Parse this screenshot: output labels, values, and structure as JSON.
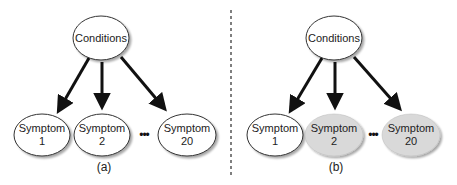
{
  "colors": {
    "observed_fill": "#d9d9d9",
    "unobserved_fill": "#ffffff",
    "stroke": "#333333",
    "arrow": "#111111",
    "divider": "#555555"
  },
  "panels": [
    {
      "label": "(a)",
      "parent": {
        "label": "Conditions"
      },
      "children": [
        {
          "line1": "Symptom",
          "line2": "1",
          "shaded": false
        },
        {
          "line1": "Symptom",
          "line2": "2",
          "shaded": false
        },
        {
          "line1": "Symptom",
          "line2": "20",
          "shaded": false
        }
      ],
      "ellipsis": "•••"
    },
    {
      "label": "(b)",
      "parent": {
        "label": "Conditions"
      },
      "children": [
        {
          "line1": "Symptom",
          "line2": "1",
          "shaded": false
        },
        {
          "line1": "Symptom",
          "line2": "2",
          "shaded": true
        },
        {
          "line1": "Symptom",
          "line2": "20",
          "shaded": true
        }
      ],
      "ellipsis": "•••"
    }
  ]
}
